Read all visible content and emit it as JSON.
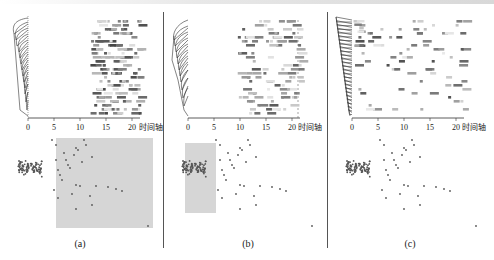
{
  "figure": {
    "panels": [
      {
        "id": "a",
        "caption": "(a)",
        "x_axis_label": "时间轴",
        "ticks": [
          "0",
          "5",
          "10",
          "15",
          "20"
        ],
        "selection": "right region (x ≥ ~8 in scatter) highlighted"
      },
      {
        "id": "b",
        "caption": "(b)",
        "x_axis_label": "时间轴",
        "ticks": [
          "0",
          "5",
          "10",
          "15",
          "20"
        ],
        "selection": "dense cluster region highlighted"
      },
      {
        "id": "c",
        "caption": "(c)",
        "x_axis_label": "时间轴",
        "ticks": [
          "0",
          "5",
          "10",
          "15",
          "20"
        ],
        "selection": "none"
      }
    ]
  },
  "chart_data": [
    {
      "type": "heatmap",
      "title": "(a)",
      "xlabel": "时间轴",
      "x_ticks": [
        0,
        5,
        10,
        15,
        20
      ],
      "xlim": [
        0,
        22
      ],
      "rows": 24,
      "description": "Dendrogram on left; activity cells concentrated at time 12-22",
      "active_time_range": [
        12,
        22
      ],
      "scatter": {
        "type": "scatter",
        "highlight_rect": {
          "x0": 56,
          "y0": 138,
          "x1": 153,
          "y1": 228
        },
        "points_count_approx": 130
      }
    },
    {
      "type": "heatmap",
      "title": "(b)",
      "xlabel": "时间轴",
      "x_ticks": [
        0,
        5,
        10,
        15,
        20
      ],
      "xlim": [
        0,
        22
      ],
      "rows": 24,
      "description": "Dendrogram on left; sparse lighter cells spread over time 10-22",
      "active_time_range": [
        10,
        22
      ],
      "scatter": {
        "type": "scatter",
        "highlight_rect": {
          "x0": 185,
          "y0": 143,
          "x1": 215,
          "y1": 213
        },
        "points_count_approx": 130
      }
    },
    {
      "type": "heatmap",
      "title": "(c)",
      "xlabel": "时间轴",
      "x_ticks": [
        0,
        5,
        10,
        15,
        20
      ],
      "xlim": [
        0,
        22
      ],
      "rows": 24,
      "description": "Dendrogram on left; sparse cells, dark cluster at time 0-3 top rows, scattered across 0-22",
      "active_time_range": [
        0,
        22
      ],
      "scatter": {
        "type": "scatter",
        "highlight_rect": null,
        "points_count_approx": 130
      }
    }
  ]
}
